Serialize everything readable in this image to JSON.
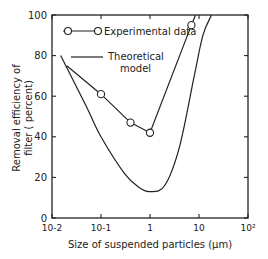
{
  "chart_data": {
    "type": "line",
    "title": "",
    "xlabel": "Size of suspended particles (µm)",
    "ylabel": "Removal efficiency of filter (percent)",
    "ylabel_line1": "Removal efficiency of",
    "ylabel_line2": "filter ( percent)",
    "xscale": "log",
    "xlim": [
      0.01,
      100
    ],
    "ylim": [
      0,
      100
    ],
    "x_tick_labels": [
      "10-2",
      "10-1",
      "1",
      "10",
      "10²"
    ],
    "y_tick_labels": [
      "0",
      "20",
      "40",
      "60",
      "80",
      "100"
    ],
    "grid": false,
    "legend": {
      "position": "upper-left-inside",
      "entries": [
        "Experimental data",
        "Theoretical model"
      ],
      "entry1": "Experimental data",
      "entry2_line1": "Theoretical",
      "entry2_line2": "model"
    },
    "series": [
      {
        "name": "Experimental data",
        "marker": "open-circle",
        "x": [
          0.02,
          0.1,
          0.4,
          1.0,
          7.0,
          8.5
        ],
        "y": [
          75,
          61,
          47,
          42,
          95,
          100
        ],
        "marked_points": [
          [
            0.1,
            61
          ],
          [
            0.4,
            47
          ],
          [
            1.0,
            42
          ],
          [
            7.0,
            95
          ]
        ]
      },
      {
        "name": "Theoretical model",
        "marker": "none",
        "x": [
          0.015,
          0.05,
          0.1,
          0.3,
          0.6,
          1.0,
          2.0,
          4.0,
          8.0,
          12.0,
          18.0
        ],
        "y": [
          80,
          55,
          40,
          22,
          15,
          13,
          16,
          35,
          70,
          90,
          100
        ]
      }
    ]
  }
}
